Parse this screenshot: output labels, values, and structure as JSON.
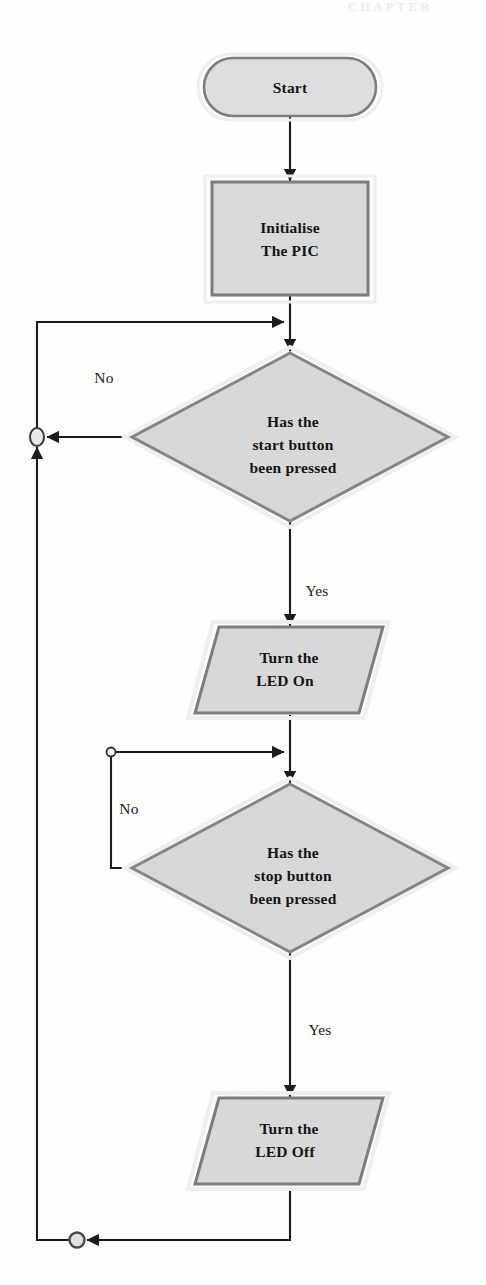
{
  "page": {
    "width": 486,
    "height": 1285,
    "background": "#fdfdfc",
    "header_ghost_text": "CHAPTER"
  },
  "diagram": {
    "type": "flowchart",
    "palette": {
      "shape_fill": "#d6d6d6",
      "shape_fill_light": "#e3e3e3",
      "shape_stroke": "#7d7d7d",
      "shape_outer_halo": "#efefef",
      "line": "#1c1c1c",
      "connector_fill": "#e8e8e8",
      "connector_stroke": "#5e5e5e",
      "text": "#151515"
    },
    "nodes": [
      {
        "id": "start",
        "shape": "terminator",
        "label": "Start",
        "lines": [
          "Start"
        ],
        "x": 290,
        "y": 87,
        "width": 172,
        "height": 58
      },
      {
        "id": "init",
        "shape": "process",
        "label": "Initialise The PIC",
        "lines": [
          "Initialise",
          "The PIC"
        ],
        "x": 290,
        "y": 238,
        "width": 155,
        "height": 112
      },
      {
        "id": "decision-start",
        "shape": "decision",
        "label": "Has the start button been pressed",
        "lines": [
          "Has the",
          "start button",
          "been pressed"
        ],
        "x": 290,
        "y": 437,
        "width": 320,
        "height": 170
      },
      {
        "id": "led-on",
        "shape": "data",
        "label": "Turn the LED On",
        "lines": [
          "Turn the",
          "LED On"
        ],
        "x": 290,
        "y": 670,
        "width": 190,
        "height": 92
      },
      {
        "id": "decision-stop",
        "shape": "decision",
        "label": "Has the stop button been pressed",
        "lines": [
          "Has the",
          "stop button",
          "been pressed"
        ],
        "x": 290,
        "y": 868,
        "width": 320,
        "height": 170
      },
      {
        "id": "led-off",
        "shape": "data",
        "label": "Turn the LED Off",
        "lines": [
          "Turn the",
          "LED Off"
        ],
        "x": 290,
        "y": 1142,
        "width": 190,
        "height": 92
      }
    ],
    "edge_labels": [
      {
        "id": "no-start",
        "text": "No",
        "x": 104,
        "y": 377
      },
      {
        "id": "yes-start",
        "text": "Yes",
        "x": 317,
        "y": 590
      },
      {
        "id": "no-stop",
        "text": "No",
        "x": 129,
        "y": 808
      },
      {
        "id": "yes-stop",
        "text": "Yes",
        "x": 320,
        "y": 1029
      }
    ],
    "connectors": [
      {
        "id": "connector-outer-loop",
        "x": 37,
        "y": 437,
        "rx": 7,
        "ry": 9
      },
      {
        "id": "connector-inner-loop",
        "x": 111,
        "y": 752,
        "rx": 5,
        "ry": 5
      },
      {
        "id": "connector-restart",
        "x": 77,
        "y": 1240,
        "rx": 8,
        "ry": 8
      }
    ],
    "edges": [
      {
        "from": "start",
        "to": "init",
        "label": ""
      },
      {
        "from": "init",
        "to": "decision-start",
        "label": ""
      },
      {
        "from": "decision-start",
        "to": "led-on",
        "label": "Yes"
      },
      {
        "from": "decision-start",
        "to": "decision-start",
        "label": "No"
      },
      {
        "from": "led-on",
        "to": "decision-stop",
        "label": ""
      },
      {
        "from": "decision-stop",
        "to": "led-off",
        "label": "Yes"
      },
      {
        "from": "decision-stop",
        "to": "decision-stop",
        "label": "No"
      },
      {
        "from": "led-off",
        "to": "decision-start",
        "label": ""
      }
    ]
  },
  "ghost_background": {
    "lines": [
      {
        "text": "the wire and",
        "x": 265,
        "y": 430
      },
      {
        "text": "turn the",
        "x": 255,
        "y": 455
      },
      {
        "text": "button",
        "x": 250,
        "y": 482
      },
      {
        "text": "pressed",
        "x": 258,
        "y": 510
      },
      {
        "text": "is on",
        "x": 262,
        "y": 630
      },
      {
        "text": "the LED On",
        "x": 258,
        "y": 660
      },
      {
        "text": "will need to",
        "x": 200,
        "y": 830
      },
      {
        "text": "the second",
        "x": 205,
        "y": 858
      },
      {
        "text": "will wait and",
        "x": 212,
        "y": 1105
      },
      {
        "text": "the LED",
        "x": 205,
        "y": 1150
      }
    ]
  }
}
